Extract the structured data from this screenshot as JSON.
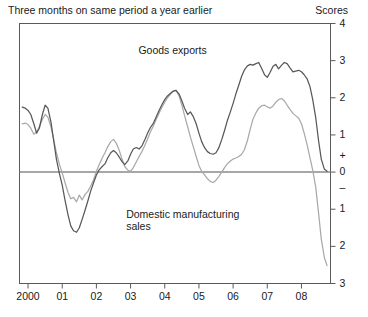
{
  "header": {
    "left": "Three months on same period a year earlier",
    "right": "Scores"
  },
  "chart_data": {
    "type": "line",
    "title": "",
    "subtitle": "Three months on same period a year earlier",
    "xlabel": "",
    "ylabel": "Scores",
    "ylim": [
      -3,
      4
    ],
    "xlim": [
      1999.75,
      2008.85
    ],
    "grid": false,
    "zero_line": true,
    "legend": "inline-annotations",
    "ytick_labels": [
      "4",
      "3",
      "2",
      "1",
      "+",
      "0",
      "–",
      "1",
      "2",
      "3"
    ],
    "ytick_values": [
      4,
      3,
      2,
      1,
      0.42,
      0,
      -0.42,
      -1,
      -2,
      -3
    ],
    "xtick_labels": [
      "2000",
      "01",
      "02",
      "03",
      "04",
      "05",
      "06",
      "07",
      "08"
    ],
    "xtick_values": [
      2000,
      2001,
      2002,
      2003,
      2004,
      2005,
      2006,
      2007,
      2008
    ],
    "annotations": [
      {
        "text": "Goods exports",
        "x": 2004.4,
        "y": 3.25
      },
      {
        "text": "Domestic manufacturing\nsales",
        "x": 2004.1,
        "y": -1.15
      }
    ],
    "series": [
      {
        "name": "Goods exports",
        "color": "#58585c",
        "x": [
          1999.83,
          1999.92,
          2000.0,
          2000.08,
          2000.17,
          2000.25,
          2000.33,
          2000.42,
          2000.5,
          2000.58,
          2000.67,
          2000.75,
          2000.83,
          2000.92,
          2001.0,
          2001.08,
          2001.17,
          2001.25,
          2001.33,
          2001.42,
          2001.5,
          2001.58,
          2001.67,
          2001.75,
          2001.83,
          2001.92,
          2002.0,
          2002.08,
          2002.17,
          2002.25,
          2002.33,
          2002.42,
          2002.5,
          2002.58,
          2002.67,
          2002.75,
          2002.83,
          2002.92,
          2003.0,
          2003.08,
          2003.17,
          2003.25,
          2003.33,
          2003.42,
          2003.5,
          2003.58,
          2003.67,
          2003.75,
          2003.83,
          2003.92,
          2004.0,
          2004.08,
          2004.17,
          2004.25,
          2004.33,
          2004.42,
          2004.5,
          2004.58,
          2004.67,
          2004.75,
          2004.83,
          2004.92,
          2005.0,
          2005.08,
          2005.17,
          2005.25,
          2005.33,
          2005.42,
          2005.5,
          2005.58,
          2005.67,
          2005.75,
          2005.83,
          2005.92,
          2006.0,
          2006.08,
          2006.17,
          2006.25,
          2006.33,
          2006.42,
          2006.5,
          2006.58,
          2006.67,
          2006.75,
          2006.83,
          2006.92,
          2007.0,
          2007.08,
          2007.17,
          2007.25,
          2007.33,
          2007.42,
          2007.5,
          2007.58,
          2007.67,
          2007.75,
          2007.83,
          2007.92,
          2008.0,
          2008.08,
          2008.17,
          2008.25,
          2008.33,
          2008.42,
          2008.5,
          2008.58,
          2008.67,
          2008.75
        ],
        "y": [
          1.75,
          1.72,
          1.66,
          1.55,
          1.3,
          1.05,
          1.18,
          1.55,
          1.8,
          1.72,
          1.35,
          0.85,
          0.35,
          -0.05,
          -0.35,
          -0.75,
          -1.15,
          -1.45,
          -1.58,
          -1.62,
          -1.5,
          -1.28,
          -1.02,
          -0.78,
          -0.52,
          -0.28,
          -0.08,
          0.06,
          0.15,
          0.22,
          0.38,
          0.52,
          0.58,
          0.52,
          0.4,
          0.28,
          0.2,
          0.3,
          0.48,
          0.62,
          0.66,
          0.62,
          0.7,
          0.88,
          1.05,
          1.2,
          1.32,
          1.48,
          1.65,
          1.82,
          1.95,
          2.05,
          2.12,
          2.18,
          2.2,
          2.1,
          1.92,
          1.72,
          1.55,
          1.62,
          1.5,
          1.3,
          1.05,
          0.82,
          0.65,
          0.55,
          0.5,
          0.48,
          0.52,
          0.65,
          0.88,
          1.12,
          1.38,
          1.62,
          1.85,
          2.1,
          2.35,
          2.58,
          2.75,
          2.86,
          2.9,
          2.88,
          2.92,
          2.95,
          2.8,
          2.62,
          2.55,
          2.68,
          2.85,
          2.9,
          2.78,
          2.88,
          2.95,
          2.92,
          2.8,
          2.7,
          2.72,
          2.74,
          2.7,
          2.62,
          2.5,
          2.3,
          1.95,
          1.45,
          0.85,
          0.35,
          0.08,
          0.02
        ]
      },
      {
        "name": "Domestic manufacturing sales",
        "color": "#a9a9ad",
        "x": [
          1999.83,
          1999.92,
          2000.0,
          2000.08,
          2000.17,
          2000.25,
          2000.33,
          2000.42,
          2000.5,
          2000.58,
          2000.67,
          2000.75,
          2000.83,
          2000.92,
          2001.0,
          2001.08,
          2001.17,
          2001.25,
          2001.33,
          2001.42,
          2001.5,
          2001.58,
          2001.67,
          2001.75,
          2001.83,
          2001.92,
          2002.0,
          2002.08,
          2002.17,
          2002.25,
          2002.33,
          2002.42,
          2002.5,
          2002.58,
          2002.67,
          2002.75,
          2002.83,
          2002.92,
          2003.0,
          2003.08,
          2003.17,
          2003.25,
          2003.33,
          2003.42,
          2003.5,
          2003.58,
          2003.67,
          2003.75,
          2003.83,
          2003.92,
          2004.0,
          2004.08,
          2004.17,
          2004.25,
          2004.33,
          2004.42,
          2004.5,
          2004.58,
          2004.67,
          2004.75,
          2004.83,
          2004.92,
          2005.0,
          2005.08,
          2005.17,
          2005.25,
          2005.33,
          2005.42,
          2005.5,
          2005.58,
          2005.67,
          2005.75,
          2005.83,
          2005.92,
          2006.0,
          2006.08,
          2006.17,
          2006.25,
          2006.33,
          2006.42,
          2006.5,
          2006.58,
          2006.67,
          2006.75,
          2006.83,
          2006.92,
          2007.0,
          2007.08,
          2007.17,
          2007.25,
          2007.33,
          2007.42,
          2007.5,
          2007.58,
          2007.67,
          2007.75,
          2007.83,
          2007.92,
          2008.0,
          2008.08,
          2008.17,
          2008.25,
          2008.33,
          2008.42,
          2008.5,
          2008.58,
          2008.67,
          2008.75
        ],
        "y": [
          1.3,
          1.32,
          1.28,
          1.18,
          1.02,
          1.08,
          1.22,
          1.42,
          1.55,
          1.48,
          1.22,
          0.88,
          0.52,
          0.2,
          -0.02,
          -0.28,
          -0.55,
          -0.72,
          -0.68,
          -0.8,
          -0.62,
          -0.75,
          -0.6,
          -0.52,
          -0.38,
          -0.2,
          0.02,
          0.2,
          0.38,
          0.52,
          0.68,
          0.82,
          0.88,
          0.78,
          0.58,
          0.35,
          0.15,
          0.05,
          0.02,
          0.12,
          0.28,
          0.42,
          0.55,
          0.72,
          0.9,
          1.08,
          1.25,
          1.42,
          1.58,
          1.75,
          1.88,
          2.0,
          2.1,
          2.18,
          2.2,
          2.05,
          1.8,
          1.52,
          1.22,
          0.95,
          0.7,
          0.42,
          0.18,
          0.02,
          -0.08,
          -0.18,
          -0.25,
          -0.28,
          -0.22,
          -0.12,
          0.0,
          0.12,
          0.22,
          0.3,
          0.35,
          0.38,
          0.42,
          0.48,
          0.6,
          0.85,
          1.15,
          1.42,
          1.6,
          1.72,
          1.78,
          1.8,
          1.76,
          1.72,
          1.78,
          1.88,
          1.95,
          1.98,
          1.92,
          1.8,
          1.68,
          1.58,
          1.52,
          1.45,
          1.3,
          1.05,
          0.72,
          0.38,
          0.05,
          -0.42,
          -1.1,
          -1.8,
          -2.3,
          -2.52
        ]
      }
    ]
  },
  "axes": {
    "y_ticks": [
      {
        "label": "4",
        "value": 4
      },
      {
        "label": "3",
        "value": 3
      },
      {
        "label": "2",
        "value": 2
      },
      {
        "label": "1",
        "value": 1
      },
      {
        "label": "+",
        "value": 0.42
      },
      {
        "label": "0",
        "value": 0
      },
      {
        "label": "–",
        "value": -0.42
      },
      {
        "label": "1",
        "value": -1
      },
      {
        "label": "2",
        "value": -2
      },
      {
        "label": "3",
        "value": -3
      }
    ],
    "x_ticks": [
      {
        "label": "2000",
        "value": 2000
      },
      {
        "label": "01",
        "value": 2001
      },
      {
        "label": "02",
        "value": 2002
      },
      {
        "label": "03",
        "value": 2003
      },
      {
        "label": "04",
        "value": 2004
      },
      {
        "label": "05",
        "value": 2005
      },
      {
        "label": "06",
        "value": 2006
      },
      {
        "label": "07",
        "value": 2007
      },
      {
        "label": "08",
        "value": 2008
      }
    ]
  },
  "annotations": {
    "goods_exports": "Goods exports",
    "domestic_sales_line1": "Domestic manufacturing",
    "domestic_sales_line2": "sales"
  }
}
